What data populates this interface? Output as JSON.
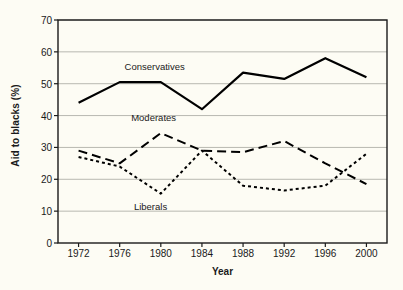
{
  "chart_data": {
    "type": "line",
    "title": "",
    "xlabel": "Year",
    "ylabel": "Aid to blacks (%)",
    "x": [
      1972,
      1976,
      1980,
      1984,
      1988,
      1992,
      1996,
      2000
    ],
    "xticklabels": [
      "1972",
      "1976",
      "1980",
      "1984",
      "1988",
      "1992",
      "1996",
      "2000"
    ],
    "yticklabels": [
      "0",
      "10",
      "20",
      "30",
      "40",
      "50",
      "60",
      "70"
    ],
    "yticks": [
      0,
      10,
      20,
      30,
      40,
      50,
      60,
      70
    ],
    "ylim": [
      0,
      70
    ],
    "xlim": [
      1970,
      2002
    ],
    "grid": "horizontal",
    "legend": "inline-annotations",
    "series": [
      {
        "name": "Conservatives",
        "style": "solid",
        "color": "#000000",
        "values": [
          44,
          50.5,
          50.5,
          42,
          53.5,
          51.5,
          58,
          52
        ]
      },
      {
        "name": "Moderates",
        "style": "long-dash",
        "color": "#000000",
        "values": [
          29,
          25,
          34.5,
          29,
          28.5,
          32,
          25,
          18.5
        ]
      },
      {
        "name": "Liberals",
        "style": "short-dash",
        "color": "#000000",
        "values": [
          27,
          24,
          15.5,
          29,
          18,
          16.5,
          18,
          28
        ]
      }
    ],
    "annotations": [
      {
        "text": "Conservatives",
        "x": 1979.4,
        "y": 55.5
      },
      {
        "text": "Moderates",
        "x": 1979.3,
        "y": 39.5
      },
      {
        "text": "Liberals",
        "x": 1979.0,
        "y": 11.5
      }
    ],
    "colors": {
      "background": "#fdfcf4",
      "gridline": "#b8b8b0",
      "axis": "#1a1a1a",
      "line": "#000000"
    }
  }
}
